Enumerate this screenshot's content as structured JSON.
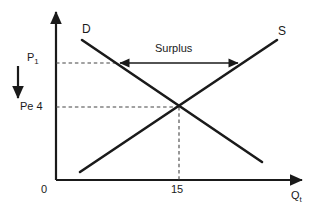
{
  "figure": {
    "background_color": "#ffffff",
    "line_color": "#1a1a1a",
    "dash_color": "#555555"
  },
  "axes": {
    "y_axis_name": "price-axis",
    "x_axis_name": "quantity-axis",
    "x_axis_label": "Q",
    "x_axis_label_subscript": "t",
    "origin_label": "0",
    "y_ticks": [
      {
        "label": "P",
        "subscript": "1",
        "value_text": "",
        "y_px": 63
      },
      {
        "label": "Pe",
        "subscript": "",
        "value_text": "4",
        "y_px": 107
      }
    ],
    "x_ticks": [
      {
        "label": "15",
        "x_px": 179
      }
    ]
  },
  "curves": [
    {
      "name": "demand-curve",
      "label": "D",
      "direction": "downward-sloping",
      "start": {
        "x": 82,
        "y": 40
      },
      "end": {
        "x": 262,
        "y": 162
      }
    },
    {
      "name": "supply-curve",
      "label": "S",
      "direction": "upward-sloping",
      "start": {
        "x": 80,
        "y": 172
      },
      "end": {
        "x": 277,
        "y": 40
      }
    }
  ],
  "equilibrium": {
    "name": "equilibrium-point",
    "price_label": "Pe",
    "price_value": "4",
    "quantity_value": "15",
    "x_px": 179,
    "y_px": 107
  },
  "annotations": [
    {
      "name": "surplus-label",
      "text": "Surplus",
      "arrow": "double-headed-horizontal",
      "from_x": 118,
      "to_x": 240,
      "y_px": 63
    },
    {
      "name": "price-fall-arrow",
      "text": "",
      "arrow": "downward",
      "x_px": 18,
      "from_y": 66,
      "to_y": 102
    }
  ],
  "dashed_guides": [
    {
      "name": "p1-guide-line",
      "orientation": "horizontal",
      "y_px": 63,
      "from_x": 56,
      "to_x": 118
    },
    {
      "name": "pe-guide-line",
      "orientation": "horizontal",
      "y_px": 107,
      "from_x": 56,
      "to_x": 179
    },
    {
      "name": "quantity-guide-line",
      "orientation": "vertical",
      "x_px": 179,
      "from_y": 107,
      "to_y": 180
    }
  ]
}
